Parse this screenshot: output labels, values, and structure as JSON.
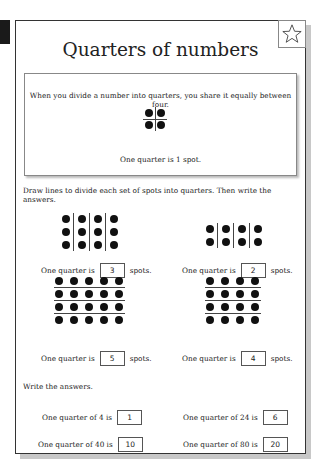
{
  "title": "Quarters of numbers",
  "star_icon": "star-icon",
  "intro": {
    "text": "When you divide a number into quarters, you share it equally between four.",
    "example": {
      "rows": 2,
      "cols": 2,
      "divider": "cross"
    },
    "caption": "One quarter is 1 spot."
  },
  "section1": {
    "instruction": "Draw lines to divide each set of spots into quarters. Then write the answers.",
    "exercises": [
      {
        "rows": 3,
        "cols": 4,
        "divider": "vertical",
        "prefix": "One quarter is",
        "answer": "3",
        "suffix": "spots."
      },
      {
        "rows": 2,
        "cols": 4,
        "divider": "vertical",
        "prefix": "One quarter is",
        "answer": "2",
        "suffix": "spots."
      },
      {
        "rows": 4,
        "cols": 5,
        "divider": "horizontal",
        "prefix": "One quarter is",
        "answer": "5",
        "suffix": "spots."
      },
      {
        "rows": 4,
        "cols": 4,
        "divider": "horizontal",
        "prefix": "One quarter is",
        "answer": "4",
        "suffix": "spots."
      }
    ]
  },
  "section2": {
    "instruction": "Write the answers.",
    "questions": [
      {
        "prompt": "One quarter of 4 is",
        "answer": "1"
      },
      {
        "prompt": "One quarter of 24 is",
        "answer": "6"
      },
      {
        "prompt": "One quarter of 40 is",
        "answer": "10"
      },
      {
        "prompt": "One quarter of 80 is",
        "answer": "20"
      }
    ]
  }
}
